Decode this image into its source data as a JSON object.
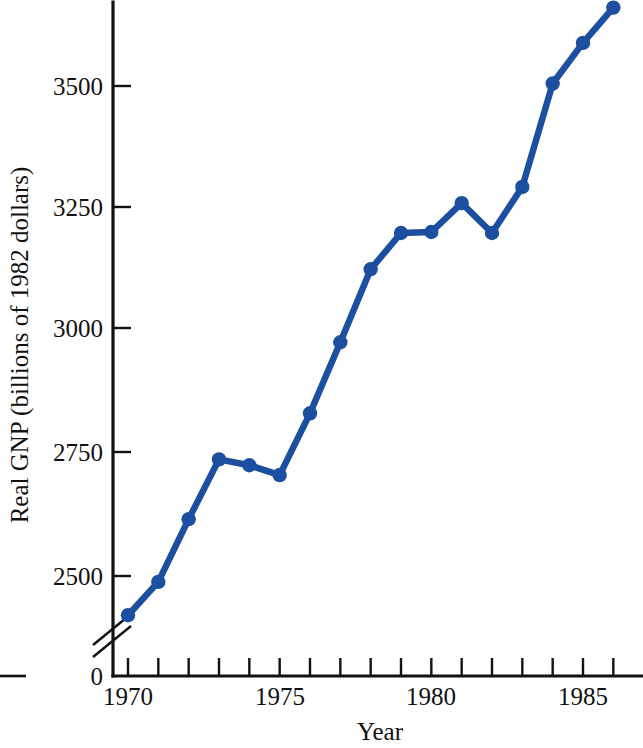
{
  "chart_data": {
    "type": "line",
    "title": "",
    "xlabel": "Year",
    "ylabel": "Real GNP (billions of 1982 dollars)",
    "x": [
      1970,
      1971,
      1972,
      1973,
      1974,
      1975,
      1976,
      1977,
      1978,
      1979,
      1980,
      1981,
      1982,
      1983,
      1984,
      1985,
      1986
    ],
    "values": [
      2420,
      2488,
      2616,
      2738,
      2726,
      2706,
      2832,
      2977,
      3126,
      3200,
      3202,
      3261,
      3200,
      3294,
      3505,
      3588,
      3660
    ],
    "series": [
      {
        "name": "Real GNP",
        "values": [
          2420,
          2488,
          2616,
          2738,
          2726,
          2706,
          2832,
          2977,
          3126,
          3200,
          3202,
          3261,
          3200,
          3294,
          3505,
          3588,
          3660
        ]
      }
    ],
    "xlim": [
      1969.4,
      1986.6
    ],
    "ylim": [
      2360,
      3690
    ],
    "y_tick_labels": [
      "2500",
      "2750",
      "3000",
      "3250",
      "3500"
    ],
    "y_tick_values": [
      2500,
      2750,
      3000,
      3250,
      3500
    ],
    "x_tick_values": [
      1970,
      1971,
      1972,
      1973,
      1974,
      1975,
      1976,
      1977,
      1978,
      1979,
      1980,
      1981,
      1982,
      1983,
      1984,
      1985,
      1986
    ],
    "x_tick_labels_shown": [
      "1970",
      "1975",
      "1980",
      "1985"
    ],
    "x_tick_labels_shown_values": [
      1970,
      1975,
      1980,
      1985
    ],
    "origin_label": "0",
    "axis_break": true,
    "grid": false,
    "legend": "none",
    "marker": "filled-circle",
    "series_color": "#1d4fa0",
    "axis_color": "#111111"
  }
}
